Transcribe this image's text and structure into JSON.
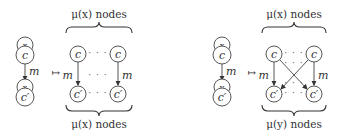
{
  "panels": [
    {
      "source": {
        "top_small": "x",
        "top_main": "c",
        "edge": "m",
        "bottom_small": "x",
        "bottom_main": "c′"
      },
      "mapsto": "↦",
      "top_label": "μ(x) nodes",
      "bottom_label": "μ(x) nodes",
      "grid": {
        "top": "c",
        "bottom": "c′",
        "edge_left": "m",
        "edge_right": "m",
        "crossed": false
      },
      "dots": "· · ·"
    },
    {
      "source": {
        "top_small": "x",
        "top_main": "c",
        "edge": "m",
        "bottom_small": "y",
        "bottom_main": "c′"
      },
      "mapsto": "↦",
      "top_label": "μ(x) nodes",
      "bottom_label": "μ(y) nodes",
      "grid": {
        "top": "c",
        "bottom": "c′",
        "edge_left": "m",
        "edge_right": "m",
        "crossed": true
      },
      "dots": "· · ·"
    }
  ]
}
